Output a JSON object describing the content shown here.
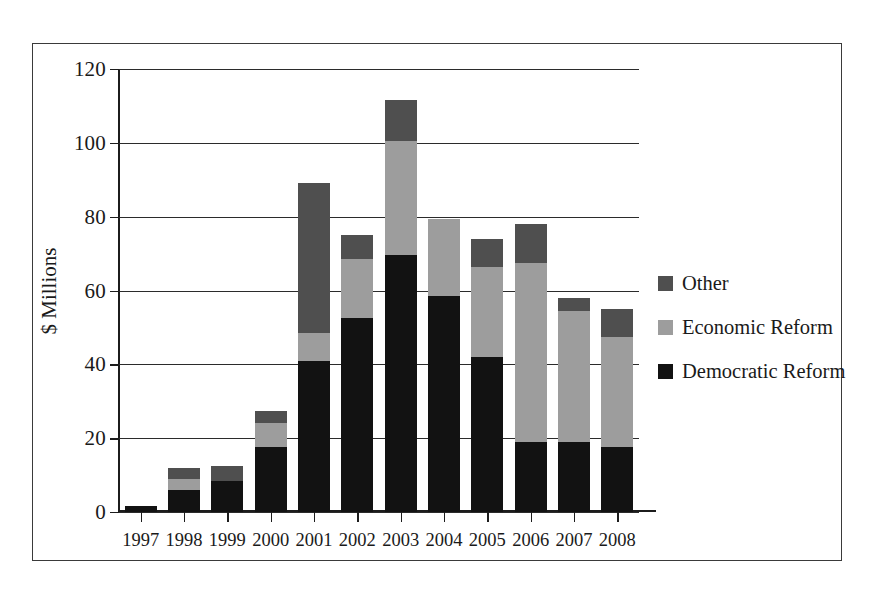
{
  "chart_data": {
    "type": "bar",
    "stacked": true,
    "title": "",
    "xlabel": "",
    "ylabel": "$ Millions",
    "ylim": [
      0,
      120
    ],
    "yticks": [
      0,
      20,
      40,
      60,
      80,
      100,
      120
    ],
    "grid": true,
    "legend_position": "right",
    "categories": [
      "1997",
      "1998",
      "1999",
      "2000",
      "2001",
      "2002",
      "2003",
      "2004",
      "2005",
      "2006",
      "2007",
      "2008"
    ],
    "series": [
      {
        "name": "Democratic Reform",
        "color": "#121212",
        "values": [
          1.5,
          6.0,
          8.5,
          17.5,
          41.0,
          52.5,
          69.5,
          58.5,
          42.0,
          19.0,
          19.0,
          17.5
        ]
      },
      {
        "name": "Economic Reform",
        "color": "#9d9d9d",
        "values": [
          0.0,
          3.0,
          0.0,
          6.5,
          7.5,
          16.0,
          31.0,
          21.0,
          24.5,
          48.5,
          35.5,
          30.0
        ]
      },
      {
        "name": "Other",
        "color": "#4f4f4f",
        "values": [
          0.0,
          3.0,
          4.0,
          3.5,
          40.5,
          6.5,
          11.0,
          0.0,
          7.5,
          10.5,
          3.5,
          7.5
        ]
      }
    ],
    "totals": [
      1.5,
      12.0,
      12.5,
      27.5,
      89.0,
      75.0,
      111.5,
      79.5,
      74.0,
      78.0,
      58.0,
      55.0
    ]
  },
  "legend": {
    "items": [
      {
        "label": "Other",
        "color": "#4f4f4f"
      },
      {
        "label": "Economic Reform",
        "color": "#9d9d9d"
      },
      {
        "label": "Democratic Reform",
        "color": "#121212"
      }
    ]
  }
}
